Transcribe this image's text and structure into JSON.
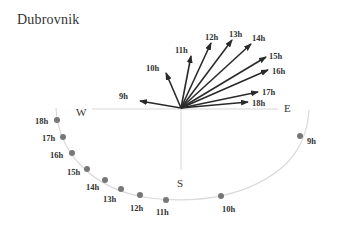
{
  "title": "Dubrovnik",
  "colors": {
    "arrow": "#2a2a2a",
    "axis": "#cfcfcf",
    "arc": "#d4d4d4",
    "dot": "#777777",
    "label": "#333333"
  },
  "directions": {
    "west": "W",
    "east": "E",
    "south": "S"
  },
  "sun_directions": [
    {
      "hour": "9h",
      "tip": [
        140,
        101
      ],
      "label": [
        119,
        99
      ]
    },
    {
      "hour": "10h",
      "tip": [
        166,
        73
      ],
      "label": [
        146,
        71
      ]
    },
    {
      "hour": "11h",
      "tip": [
        191,
        56
      ],
      "label": [
        175,
        53
      ]
    },
    {
      "hour": "12h",
      "tip": [
        211,
        43
      ],
      "label": [
        205,
        40
      ]
    },
    {
      "hour": "13h",
      "tip": [
        232,
        40
      ],
      "label": [
        229,
        37
      ]
    },
    {
      "hour": "14h",
      "tip": [
        251,
        44
      ],
      "label": [
        252,
        41
      ]
    },
    {
      "hour": "15h",
      "tip": [
        266,
        57
      ],
      "label": [
        269,
        59
      ]
    },
    {
      "hour": "16h",
      "tip": [
        268,
        70
      ],
      "label": [
        272,
        74
      ]
    },
    {
      "hour": "17h",
      "tip": [
        258,
        92
      ],
      "label": [
        262,
        95
      ]
    },
    {
      "hour": "18h",
      "tip": [
        248,
        102
      ],
      "label": [
        252,
        106
      ]
    }
  ],
  "shadow_points": [
    {
      "hour": "18h",
      "pos": [
        57,
        120
      ],
      "label": [
        35,
        124
      ]
    },
    {
      "hour": "17h",
      "pos": [
        63,
        137
      ],
      "label": [
        42,
        141
      ]
    },
    {
      "hour": "16h",
      "pos": [
        72,
        153
      ],
      "label": [
        50,
        158
      ]
    },
    {
      "hour": "15h",
      "pos": [
        87,
        169
      ],
      "label": [
        67,
        175
      ]
    },
    {
      "hour": "14h",
      "pos": [
        105,
        180
      ],
      "label": [
        86,
        190
      ]
    },
    {
      "hour": "13h",
      "pos": [
        121,
        189
      ],
      "label": [
        103,
        202
      ]
    },
    {
      "hour": "12h",
      "pos": [
        140,
        195
      ],
      "label": [
        130,
        211
      ]
    },
    {
      "hour": "11h",
      "pos": [
        166,
        200
      ],
      "label": [
        156,
        215
      ]
    },
    {
      "hour": "10h",
      "pos": [
        221,
        196
      ],
      "label": [
        222,
        212
      ]
    },
    {
      "hour": "9h",
      "pos": [
        300,
        136
      ],
      "label": [
        307,
        144
      ]
    }
  ]
}
